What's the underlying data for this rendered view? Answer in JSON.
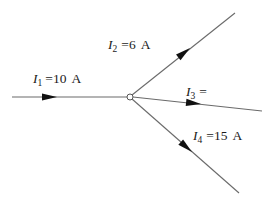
{
  "diagram": {
    "node": {
      "x": 130,
      "y": 97,
      "r": 3
    },
    "branches": [
      {
        "id": "I1",
        "symbol": "I",
        "subscript": "1",
        "equals": "=",
        "value": "10",
        "unit": "A",
        "direction": "into-node",
        "start": [
          12,
          97
        ],
        "end": [
          127,
          97
        ],
        "arrow": {
          "tip": [
            57,
            97
          ],
          "angle": 0
        },
        "label_pos": [
          33,
          83
        ]
      },
      {
        "id": "I2",
        "symbol": "I",
        "subscript": "2",
        "equals": "=",
        "value": "6",
        "unit": "A",
        "direction": "out-of-node",
        "start": [
          132,
          95
        ],
        "end": [
          235,
          13
        ],
        "arrow": {
          "tip": [
            190,
            48
          ],
          "angle": -38.5
        },
        "label_pos": [
          108,
          49
        ]
      },
      {
        "id": "I3",
        "symbol": "I",
        "subscript": "3",
        "equals": "=",
        "value": "",
        "unit": "",
        "direction": "out-of-node",
        "start": [
          133,
          97
        ],
        "end": [
          262,
          111
        ],
        "arrow": {
          "tip": [
            201,
            104
          ],
          "angle": 6.2
        },
        "label_pos": [
          186,
          96
        ]
      },
      {
        "id": "I4",
        "symbol": "I",
        "subscript": "4",
        "equals": "=",
        "value": "15",
        "unit": "A",
        "direction": "out-of-node",
        "start": [
          132,
          99
        ],
        "end": [
          239,
          193
        ],
        "arrow": {
          "tip": [
            192,
            152
          ],
          "angle": 41.3
        },
        "label_pos": [
          193,
          140
        ]
      }
    ],
    "colors": {
      "wire": "#6a6a6a",
      "arrow": "#111111",
      "text": "#1a1a1a",
      "background": "#ffffff"
    }
  }
}
